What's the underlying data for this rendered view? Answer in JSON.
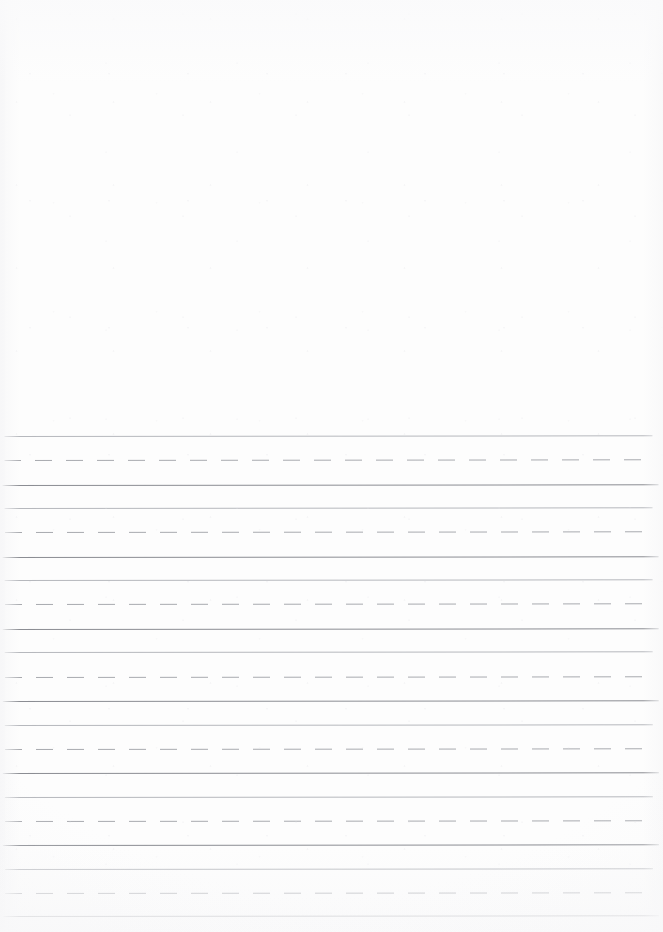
{
  "document": {
    "kind": "primary-handwriting-practice-paper",
    "title": "Primary Handwriting Paper",
    "page_width": 663,
    "page_height": 932,
    "background_color": "#fdfdfd",
    "orientation": "portrait",
    "content_text": ""
  },
  "drawing_area": {
    "label": "Blank drawing area",
    "x": 0,
    "y": 0,
    "width": 663,
    "height": 436,
    "is_empty": true
  },
  "writing_area": {
    "label": "Ruled writing area",
    "x": 0,
    "y": 436,
    "width": 663,
    "height": 496,
    "line_start_x": 4,
    "line_end_x": 652,
    "group_count": 7,
    "group_height": 72,
    "lines_per_group": 3
  },
  "line_styles": {
    "solid_dark": {
      "name": "baseline",
      "color": "#8b8d93",
      "thickness": 1,
      "style": "solid"
    },
    "solid_light": {
      "name": "headline",
      "color": "#b6b8bd",
      "thickness": 1,
      "style": "solid"
    },
    "dashed": {
      "name": "midline",
      "color": "#a8aaaf",
      "thickness": 1,
      "style": "dashed",
      "dash_length": 17,
      "dash_gap": 14
    }
  },
  "rules": [
    {
      "y": 436,
      "style": "solid_light",
      "x1": 4,
      "x2": 652
    },
    {
      "y": 460,
      "style": "dashed",
      "x1": 4,
      "x2": 648
    },
    {
      "y": 485,
      "style": "solid_dark",
      "x1": 2,
      "x2": 658
    },
    {
      "y": 508,
      "style": "solid_light",
      "x1": 4,
      "x2": 652
    },
    {
      "y": 532,
      "style": "dashed",
      "x1": 4,
      "x2": 648
    },
    {
      "y": 557,
      "style": "solid_dark",
      "x1": 2,
      "x2": 658
    },
    {
      "y": 580,
      "style": "solid_light",
      "x1": 4,
      "x2": 652
    },
    {
      "y": 604,
      "style": "dashed",
      "x1": 4,
      "x2": 648
    },
    {
      "y": 629,
      "style": "solid_dark",
      "x1": 2,
      "x2": 658
    },
    {
      "y": 652,
      "style": "solid_light",
      "x1": 4,
      "x2": 652
    },
    {
      "y": 677,
      "style": "dashed",
      "x1": 4,
      "x2": 648
    },
    {
      "y": 701,
      "style": "solid_dark",
      "x1": 2,
      "x2": 658
    },
    {
      "y": 725,
      "style": "solid_light",
      "x1": 4,
      "x2": 652
    },
    {
      "y": 749,
      "style": "dashed",
      "x1": 4,
      "x2": 648
    },
    {
      "y": 773,
      "style": "solid_dark",
      "x1": 2,
      "x2": 658
    },
    {
      "y": 797,
      "style": "solid_light",
      "x1": 4,
      "x2": 652
    },
    {
      "y": 821,
      "style": "dashed",
      "x1": 4,
      "x2": 648
    },
    {
      "y": 845,
      "style": "solid_dark",
      "x1": 2,
      "x2": 658
    },
    {
      "y": 869,
      "style": "solid_light",
      "x1": 4,
      "x2": 652
    },
    {
      "y": 893,
      "style": "dashed",
      "x1": 4,
      "x2": 648
    },
    {
      "y": 916,
      "style": "solid_dark",
      "x1": 2,
      "x2": 658
    }
  ]
}
